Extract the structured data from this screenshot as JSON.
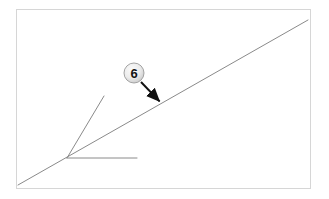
{
  "figure": {
    "kind": "technical-line-drawing",
    "width": 329,
    "height": 199,
    "background_color": "#ffffff",
    "frame": {
      "label": "drawing-frame",
      "color": "#d6d6d6",
      "stroke_width": 1,
      "x": 16,
      "y": 9,
      "width": 294,
      "height": 179
    },
    "line_color": "#8a8a8a",
    "line_width": 1,
    "geometry": {
      "main_diagonal": {
        "label": "main-diagonal-line",
        "x1": 18,
        "y1": 185,
        "x2": 308,
        "y2": 20
      },
      "vertex": {
        "label": "ray-vertex",
        "x": 67,
        "y": 158
      },
      "steep_ray": {
        "label": "steep-ray",
        "x1": 67,
        "y1": 158,
        "x2": 104,
        "y2": 96
      },
      "horizontal_ray": {
        "label": "horizontal-ray",
        "x1": 67,
        "y1": 158,
        "x2": 137,
        "y2": 158
      }
    },
    "callout": {
      "label": "6",
      "badge": {
        "center_x": 134,
        "center_y": 73,
        "radius": 10,
        "fill_center_color": "#f2f2f2",
        "fill_edge_color": "#c9c9c9",
        "ring_color": "#9a9a9a",
        "text_color": "#141414"
      },
      "leader_arrow": {
        "label": "leader-arrow",
        "color": "#111111",
        "stroke_width": 2,
        "x1": 141,
        "y1": 82,
        "x2": 163,
        "y2": 105,
        "head_length": 9,
        "head_width": 7
      }
    }
  }
}
